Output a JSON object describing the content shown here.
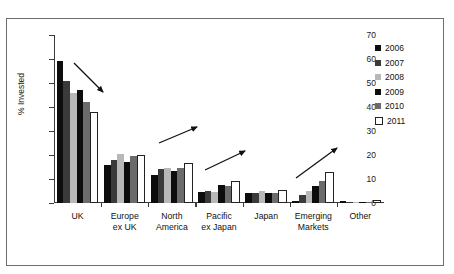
{
  "chart_data": {
    "type": "bar",
    "title": "",
    "xlabel": "",
    "ylabel": "% Invested",
    "ylim": [
      0,
      70
    ],
    "yticks": [
      0,
      10,
      20,
      30,
      40,
      50,
      60,
      70
    ],
    "grid": false,
    "legend_position": "right",
    "categories": [
      "UK",
      "Europe ex UK",
      "North America",
      "Pacific ex Japan",
      "Japan",
      "Emerging Markets",
      "Other"
    ],
    "category_lines": [
      [
        "UK"
      ],
      [
        "Europe",
        "ex UK"
      ],
      [
        "North",
        "America"
      ],
      [
        "Pacific",
        "ex Japan"
      ],
      [
        "Japan"
      ],
      [
        "Emerging",
        "Markets"
      ],
      [
        "Other"
      ]
    ],
    "series": [
      {
        "name": "2006",
        "color": "#0d0d0d",
        "values": [
          59,
          16,
          11.5,
          4.5,
          4,
          1,
          1
        ]
      },
      {
        "name": "2007",
        "color": "#3a3a3a",
        "values": [
          51,
          18,
          14,
          5,
          4,
          3.5,
          0.3
        ]
      },
      {
        "name": "2008",
        "color": "#b8b8b8",
        "values": [
          46,
          20.5,
          14.5,
          4.5,
          5,
          5,
          0.3
        ]
      },
      {
        "name": "2009",
        "color": "#0d0d0d",
        "values": [
          47,
          17,
          13.5,
          7.5,
          4,
          7,
          0.3
        ]
      },
      {
        "name": "2010",
        "color": "#6b6b6b",
        "values": [
          42,
          19.5,
          14.5,
          7,
          4,
          9,
          0.3
        ]
      },
      {
        "name": "2011",
        "color": "#ffffff",
        "values": [
          37,
          19,
          16,
          8.5,
          4.5,
          12,
          0.3
        ]
      }
    ],
    "annotations": [
      {
        "label": "downward-trend-arrow-uk",
        "group": "UK",
        "direction": "down-right"
      },
      {
        "label": "upward-trend-arrow-north-america",
        "group": "North America",
        "direction": "up-right"
      },
      {
        "label": "upward-trend-arrow-pacific-ex-japan",
        "group": "Pacific ex Japan",
        "direction": "up-right"
      },
      {
        "label": "upward-trend-arrow-emerging-markets",
        "group": "Emerging Markets",
        "direction": "up-right"
      }
    ]
  }
}
